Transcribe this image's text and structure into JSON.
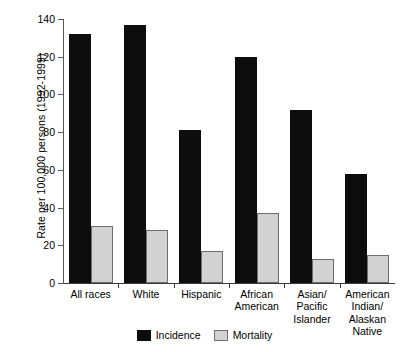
{
  "chart_data": {
    "type": "bar",
    "title": "",
    "subtitle": "",
    "xlabel": "",
    "ylabel": "Rate per 100,000 persons (1992-1999)",
    "ylim": [
      0,
      140
    ],
    "yticks": [
      0,
      20,
      40,
      60,
      80,
      100,
      120,
      140
    ],
    "ytick_labels": [
      "0",
      "20",
      "40",
      "60",
      "80",
      "100",
      "120",
      "140"
    ],
    "grid": false,
    "legend_position": "bottom-center",
    "categories": [
      "All races",
      "White",
      "Hispanic",
      "African\nAmerican",
      "Asian/\nPacific\nIslander",
      "American\nIndian/\nAlaskan\nNative"
    ],
    "series": [
      {
        "name": "Incidence",
        "color": "#0d0d0d",
        "values": [
          132,
          137,
          81,
          120,
          92,
          58
        ]
      },
      {
        "name": "Mortality",
        "color": "#d2d2d2",
        "values": [
          30,
          28,
          17,
          37,
          13,
          15
        ]
      }
    ]
  },
  "legend": {
    "items": [
      {
        "label": "Incidence",
        "swatch": "incidence"
      },
      {
        "label": "Mortality",
        "swatch": "mortality"
      }
    ]
  }
}
